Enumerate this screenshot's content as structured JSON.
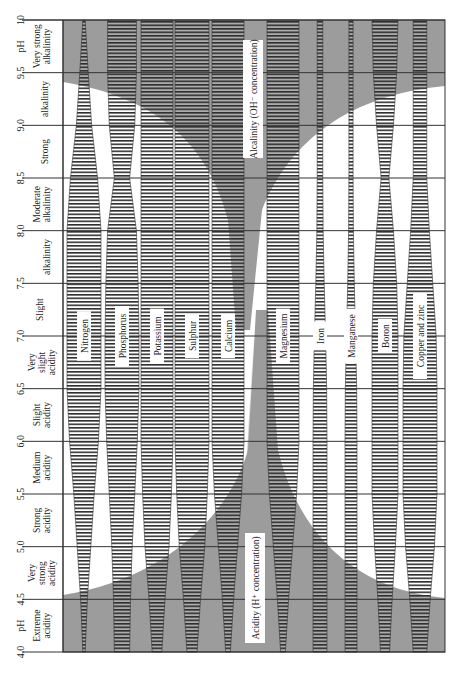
{
  "chart_data": {
    "type": "area",
    "orientation": "rotated-90",
    "title": "",
    "ylabel": "pH",
    "ylim": [
      4.0,
      10.0
    ],
    "ph_ticks": [
      "4.0",
      "4.5",
      "5.0",
      "5.5",
      "6.0",
      "6.5",
      "7.0",
      "7.5",
      "8.0",
      "8.5",
      "9.0",
      "9.5",
      "10"
    ],
    "reaction_classes": [
      {
        "label": "Extreme acidity",
        "from": 4.0,
        "to": 4.5
      },
      {
        "label": "Very strong acidity",
        "from": 4.5,
        "to": 5.0
      },
      {
        "label": "Strong acidity",
        "from": 5.0,
        "to": 5.5
      },
      {
        "label": "Medium acidity",
        "from": 5.5,
        "to": 6.0
      },
      {
        "label": "Slight acidity",
        "from": 6.0,
        "to": 6.5
      },
      {
        "label": "Very slight acidity",
        "from": 6.5,
        "to": 7.0
      },
      {
        "label": "Slight alkalinity",
        "from": 7.0,
        "to": 8.0
      },
      {
        "label": "Moderate alkalinity",
        "from": 8.0,
        "to": 8.5
      },
      {
        "label": "Strong alkalinity",
        "from": 8.5,
        "to": 9.5
      },
      {
        "label": "Very strong alkalinity",
        "from": 9.5,
        "to": 10.0
      }
    ],
    "regions": [
      {
        "label": "Acidity (H⁺ concentration)",
        "side": "low pH"
      },
      {
        "label": "Alcalinity (OH⁻ concentration)",
        "side": "high pH"
      }
    ],
    "pH_axis_labels": [
      "pH",
      "pH"
    ],
    "x": [
      4.0,
      4.5,
      5.0,
      5.5,
      6.0,
      6.5,
      7.0,
      7.5,
      8.0,
      8.5,
      9.0,
      9.5,
      10.0
    ],
    "series": [
      {
        "name": "Nitrogen",
        "values": [
          0.05,
          0.2,
          0.4,
          0.6,
          0.85,
          1.0,
          1.0,
          1.0,
          1.0,
          0.8,
          0.45,
          0.25,
          0.05
        ]
      },
      {
        "name": "Phosphorus",
        "values": [
          0.45,
          0.5,
          0.6,
          0.75,
          0.9,
          1.0,
          1.0,
          0.95,
          0.85,
          0.45,
          0.75,
          0.85,
          0.85
        ]
      },
      {
        "name": "Potassium",
        "values": [
          0.3,
          0.5,
          0.75,
          0.9,
          1.0,
          1.0,
          1.0,
          1.0,
          1.0,
          1.0,
          1.0,
          1.0,
          1.0
        ]
      },
      {
        "name": "Sulphur",
        "values": [
          0.3,
          0.5,
          0.75,
          0.9,
          1.0,
          1.0,
          1.0,
          1.0,
          1.0,
          1.0,
          1.0,
          1.0,
          1.0
        ]
      },
      {
        "name": "Calcium",
        "values": [
          0.15,
          0.35,
          0.6,
          0.85,
          1.0,
          1.0,
          1.0,
          1.0,
          1.0,
          1.0,
          1.0,
          1.0,
          1.0
        ]
      },
      {
        "name": "Magnesium",
        "values": [
          0.15,
          0.35,
          0.6,
          0.85,
          1.0,
          1.0,
          1.0,
          1.0,
          1.0,
          1.0,
          1.0,
          1.0,
          1.0
        ]
      },
      {
        "name": "Iron",
        "values": [
          1.0,
          1.0,
          1.0,
          1.0,
          1.0,
          0.95,
          0.8,
          0.6,
          0.45,
          0.4,
          0.4,
          0.4,
          0.4
        ]
      },
      {
        "name": "Manganese",
        "values": [
          1.0,
          1.0,
          1.0,
          1.0,
          1.0,
          0.95,
          0.75,
          0.55,
          0.4,
          0.35,
          0.35,
          0.35,
          0.35
        ]
      },
      {
        "name": "Boron",
        "values": [
          0.35,
          0.55,
          0.8,
          1.0,
          1.0,
          1.0,
          1.0,
          0.9,
          0.65,
          0.3,
          0.65,
          0.9,
          1.0
        ]
      },
      {
        "name": "Copper and zinc",
        "values": [
          0.4,
          0.6,
          0.85,
          1.0,
          1.0,
          1.0,
          0.95,
          0.75,
          0.55,
          0.4,
          0.4,
          0.4,
          0.4
        ]
      }
    ],
    "grid": true,
    "legend": "none (labels inside bands)"
  },
  "caption_partial": "Figure caption (clipped at bottom edge)",
  "colors": {
    "shade": "#9c9c9c",
    "light_shade": "#d6d6d6",
    "grid": "#333333",
    "hatch": "#333333",
    "background": "#ffffff"
  }
}
